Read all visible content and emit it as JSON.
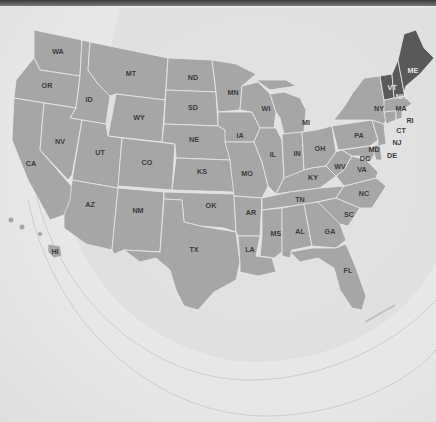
{
  "map": {
    "title": "United States map",
    "highlight_color": "#595959",
    "base_color": "#a6a6a6",
    "background_color": "#ebebeb",
    "highlighted_states": [
      "ME",
      "VT",
      "NH"
    ],
    "states": {
      "WA": "WA",
      "OR": "OR",
      "CA": "CA",
      "ID": "ID",
      "NV": "NV",
      "MT": "MT",
      "WY": "WY",
      "UT": "UT",
      "AZ": "AZ",
      "CO": "CO",
      "NM": "NM",
      "ND": "ND",
      "SD": "SD",
      "NE": "NE",
      "KS": "KS",
      "OK": "OK",
      "TX": "TX",
      "MN": "MN",
      "IA": "IA",
      "MO": "MO",
      "AR": "AR",
      "LA": "LA",
      "WI": "WI",
      "IL": "IL",
      "MI": "MI",
      "IN": "IN",
      "OH": "OH",
      "KY": "KY",
      "TN": "TN",
      "MS": "MS",
      "AL": "AL",
      "GA": "GA",
      "FL": "FL",
      "SC": "SC",
      "NC": "NC",
      "VA": "VA",
      "WV": "WV",
      "PA": "PA",
      "NY": "NY",
      "VT": "VT",
      "NH": "NH",
      "ME": "ME",
      "MA": "MA",
      "RI": "RI",
      "CT": "CT",
      "NJ": "NJ",
      "DE": "DE",
      "MD": "MD",
      "DC": "DC",
      "HI": "HI"
    }
  }
}
